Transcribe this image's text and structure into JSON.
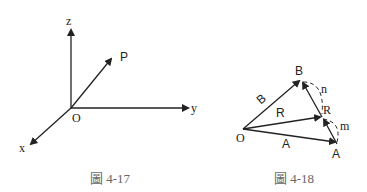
{
  "figures": [
    {
      "caption": "圖 4-17",
      "labels": {
        "z": "z",
        "y": "y",
        "x": "x",
        "origin": "O",
        "point": "P"
      }
    },
    {
      "caption": "圖 4-18",
      "labels": {
        "origin": "O",
        "B_end": "B",
        "A_end": "A",
        "R_end": "R",
        "vec_B": "B",
        "vec_R": "R",
        "vec_A": "A",
        "n": "n",
        "m": "m"
      }
    }
  ],
  "colors": {
    "line": "#222222",
    "caption": "#666666"
  }
}
